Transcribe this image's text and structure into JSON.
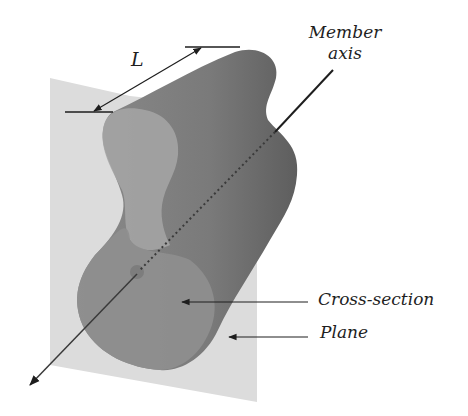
{
  "diagram": {
    "labels": {
      "length": "L",
      "member_axis_line1": "Member",
      "member_axis_line2": "axis",
      "cross_section": "Cross-section",
      "plane": "Plane"
    },
    "colors": {
      "background": "#ffffff",
      "plane": "#dcdcdc",
      "member_body": "#7a7a7a",
      "member_top": "#8a8a8a",
      "cross_section": "#8f8f8f",
      "cross_section_far": "#a6a6a6",
      "lines": "#1e1e1e"
    }
  }
}
